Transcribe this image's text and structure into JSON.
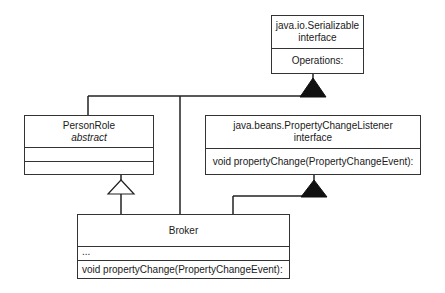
{
  "diagram": {
    "type": "UML class diagram",
    "classes": [
      {
        "id": "serializable",
        "name": "java.io.Serializable",
        "stereotype": "interface",
        "operations_label": "Operations:"
      },
      {
        "id": "personrole",
        "name": "PersonRole",
        "stereotype": "abstract",
        "attributes": "",
        "operations": ""
      },
      {
        "id": "pcl",
        "name": "java.beans.PropertyChangeListener",
        "stereotype": "interface",
        "operations": "void propertyChange(PropertyChangeEvent):"
      },
      {
        "id": "broker",
        "name": "Broker",
        "attributes": "...",
        "operations": "void propertyChange(PropertyChangeEvent):"
      }
    ],
    "relationships": [
      {
        "from": "PersonRole",
        "to": "java.io.Serializable",
        "kind": "realization",
        "arrow": "filled-triangle"
      },
      {
        "from": "Broker",
        "to": "java.io.Serializable",
        "kind": "realization",
        "arrow": "filled-triangle"
      },
      {
        "from": "Broker",
        "to": "PersonRole",
        "kind": "generalization",
        "arrow": "hollow-triangle"
      },
      {
        "from": "Broker",
        "to": "java.beans.PropertyChangeListener",
        "kind": "realization",
        "arrow": "filled-triangle"
      }
    ]
  }
}
